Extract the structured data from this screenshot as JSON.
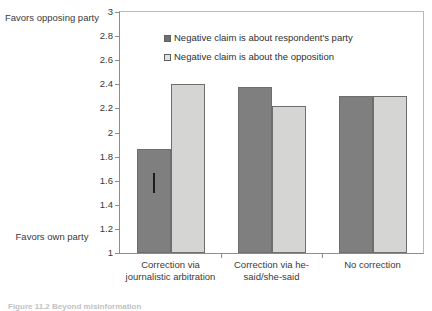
{
  "axis_annotations": {
    "top_label": "Favors opposing party",
    "bottom_label": "Favors own party"
  },
  "caption": {
    "text": "Figure 11.2  Beyond misinformation"
  },
  "chart_data": {
    "type": "bar",
    "title": "",
    "xlabel": "",
    "ylabel": "",
    "categories": [
      "Correction via journalistic arbitration",
      "Correction via he-said/she-said",
      "No correction"
    ],
    "series": [
      {
        "name": "Negative claim is about respondent's party",
        "color": "#807f7f",
        "values": [
          1.86,
          2.38,
          2.3
        ]
      },
      {
        "name": "Negative claim is about the opposition",
        "color": "#d5d5d3",
        "values": [
          2.4,
          2.22,
          2.3
        ]
      }
    ],
    "error_bars": [
      {
        "series": 0,
        "category": 0,
        "low": 1.5,
        "high": 1.66
      }
    ],
    "ylim": [
      1,
      3
    ],
    "ytick_values": [
      3,
      2.8,
      2.6,
      2.4,
      2.2,
      2,
      1.8,
      1.6,
      1.4,
      1.2,
      1
    ],
    "ytick_labels": [
      "3",
      "2.8",
      "2.6",
      "2.4",
      "2.2",
      "2",
      "1.8",
      "1.6",
      "1.4",
      "1.2",
      "1"
    ],
    "grid": false,
    "legend_position": "top-center-inside"
  }
}
